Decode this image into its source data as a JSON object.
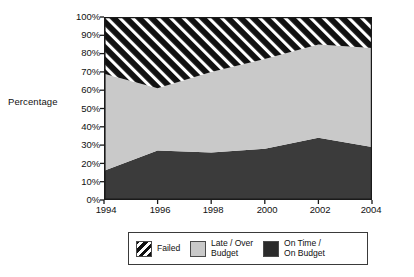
{
  "chart_data": {
    "type": "area",
    "title": "",
    "subtitle": "",
    "xlabel": "",
    "ylabel": "Percentage",
    "stacked": true,
    "stack_total": 100,
    "grid": false,
    "legend_position": "bottom",
    "x": [
      1994,
      1996,
      1998,
      2000,
      2002,
      2004
    ],
    "categories": [
      "1994",
      "1996",
      "1998",
      "2000",
      "2002",
      "2004"
    ],
    "xlim": [
      1994,
      2004
    ],
    "ylim": [
      0,
      100
    ],
    "x_tick_labels": [
      "1994",
      "1996",
      "1998",
      "2000",
      "2002",
      "2004"
    ],
    "y_tick_labels": [
      "0%",
      "10%",
      "20%",
      "30%",
      "40%",
      "50%",
      "60%",
      "70%",
      "80%",
      "90%",
      "100%"
    ],
    "y_tick_values": [
      0,
      10,
      20,
      30,
      40,
      50,
      60,
      70,
      80,
      90,
      100
    ],
    "series": [
      {
        "name": "On Time / On Budget",
        "values": [
          16,
          27,
          26,
          28,
          34,
          29
        ],
        "fill": "#3b3b3b",
        "pattern": "solid-dark",
        "stack_order": 1
      },
      {
        "name": "Late / Over Budget",
        "values": [
          53,
          34,
          44,
          49,
          51,
          54
        ],
        "cumulative_top": [
          69,
          61,
          70,
          77,
          85,
          83
        ],
        "fill": "#c9c9c9",
        "pattern": "solid-light",
        "stack_order": 2
      },
      {
        "name": "Failed",
        "values": [
          31,
          39,
          30,
          23,
          15,
          17
        ],
        "cumulative_top": [
          100,
          100,
          100,
          100,
          100,
          100
        ],
        "fill": "#111111",
        "pattern": "diagonal-hatch-white-on-black",
        "stack_order": 3
      }
    ]
  },
  "axes": {
    "y_title": "Percentage",
    "y_ticks": [
      "100%",
      "90%",
      "80%",
      "70%",
      "60%",
      "50%",
      "40%",
      "30%",
      "20%",
      "10%",
      "0%"
    ],
    "x_ticks": [
      "1994",
      "1996",
      "1998",
      "2000",
      "2002",
      "2004"
    ]
  },
  "legend": {
    "items": [
      {
        "label": "Failed",
        "swatch": "diagonal-hatch-white-on-black",
        "color": "#111111"
      },
      {
        "label": "Late / Over\nBudget",
        "swatch": "solid-light",
        "color": "#c9c9c9"
      },
      {
        "label": "On Time /\nOn Budget",
        "swatch": "solid-dark",
        "color": "#2b2b2b"
      }
    ]
  },
  "colors": {
    "failed": "#111111",
    "late_over_budget": "#c9c9c9",
    "on_time_on_budget": "#3b3b3b",
    "axis": "#1a1a1a",
    "text": "#111111",
    "background": "#ffffff"
  }
}
